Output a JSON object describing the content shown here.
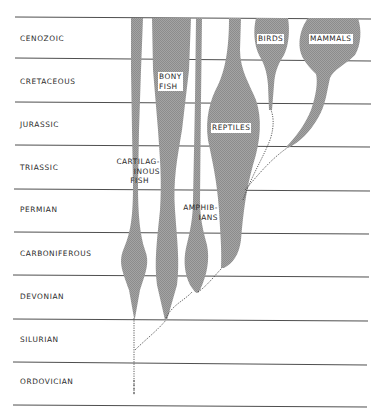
{
  "diagram": {
    "type": "phylogenetic spindle diagram",
    "periods": [
      {
        "name": "CENOZOIC",
        "top": 17,
        "bottom": 58
      },
      {
        "name": "CRETACEOUS",
        "top": 58,
        "bottom": 102
      },
      {
        "name": "JURASSIC",
        "top": 102,
        "bottom": 145
      },
      {
        "name": "TRIASSIC",
        "top": 145,
        "bottom": 189
      },
      {
        "name": "PERMIAN",
        "top": 189,
        "bottom": 232
      },
      {
        "name": "CARBONIFEROUS",
        "top": 232,
        "bottom": 275
      },
      {
        "name": "DEVONIAN",
        "top": 275,
        "bottom": 319
      },
      {
        "name": "SILURIAN",
        "top": 319,
        "bottom": 362
      },
      {
        "name": "ORDOVICIAN",
        "top": 362,
        "bottom": 405
      }
    ],
    "groups": {
      "cartilaginous_fish": {
        "line1": "CARTILAG-",
        "line2": "INOUS",
        "line3": "FISH"
      },
      "bony_fish": {
        "line1": "BONY",
        "line2": "FISH"
      },
      "amphibians": {
        "line1": "AMPHIB-",
        "line2": "IANS"
      },
      "reptiles": {
        "label": "REPTILES"
      },
      "birds": {
        "label": "BIRDS"
      },
      "mammals": {
        "label": "MAMMALS"
      }
    },
    "colors": {
      "fill": "#9a9a9a",
      "lines": "#3a3a3a",
      "background": "#ffffff"
    }
  }
}
